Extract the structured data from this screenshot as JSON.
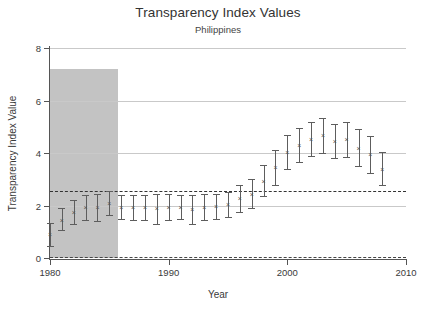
{
  "chart_data": {
    "type": "scatter",
    "title": "Transparency Index Values",
    "subtitle": "Philippines",
    "xlabel": "Year",
    "ylabel": "Transparency Index Value",
    "xlim": [
      1980,
      2010
    ],
    "ylim": [
      0,
      8
    ],
    "xticks": [
      1980,
      1990,
      2000,
      2010
    ],
    "yticks": [
      0,
      2,
      4,
      6,
      8
    ],
    "grid": true,
    "legend": "none",
    "reference_lines": [
      {
        "name": "mean-reference-line",
        "y": 2.55,
        "style": "dash-dot"
      },
      {
        "name": "zero-line",
        "y": 0.02,
        "style": "dashed"
      }
    ],
    "shaded_region": {
      "name": "highlight-band",
      "x_start": 1980.0,
      "x_end": 1985.7,
      "y_start": 0,
      "y_end": 7.2,
      "color": "#c3c3c3"
    },
    "x": [
      1980,
      1981,
      1982,
      1983,
      1984,
      1985,
      1986,
      1987,
      1988,
      1989,
      1990,
      1991,
      1992,
      1993,
      1994,
      1995,
      1996,
      1997,
      1998,
      1999,
      2000,
      2001,
      2002,
      2003,
      2004,
      2005,
      2006,
      2007,
      2008
    ],
    "values": [
      0.9,
      1.45,
      1.75,
      1.95,
      1.95,
      2.1,
      1.95,
      1.95,
      1.95,
      1.9,
      1.95,
      1.95,
      1.85,
      1.95,
      2.0,
      2.05,
      2.3,
      2.45,
      2.95,
      3.45,
      4.05,
      4.3,
      4.55,
      4.7,
      4.45,
      4.55,
      4.2,
      3.95,
      3.4
    ],
    "lower": [
      0.45,
      1.05,
      1.3,
      1.45,
      1.4,
      1.65,
      1.5,
      1.45,
      1.45,
      1.3,
      1.45,
      1.5,
      1.3,
      1.45,
      1.5,
      1.55,
      1.75,
      1.9,
      2.35,
      2.8,
      3.4,
      3.65,
      3.9,
      4.0,
      3.8,
      3.85,
      3.5,
      3.25,
      2.8
    ],
    "upper": [
      1.35,
      1.9,
      2.2,
      2.4,
      2.45,
      2.55,
      2.4,
      2.4,
      2.4,
      2.45,
      2.45,
      2.4,
      2.4,
      2.45,
      2.45,
      2.5,
      2.8,
      3.0,
      3.55,
      4.1,
      4.7,
      4.95,
      5.2,
      5.35,
      5.1,
      5.2,
      4.9,
      4.65,
      4.05
    ],
    "series_name": "Transparency Index Value",
    "marker": "x",
    "errorbar_color": "#5d5d5d"
  }
}
